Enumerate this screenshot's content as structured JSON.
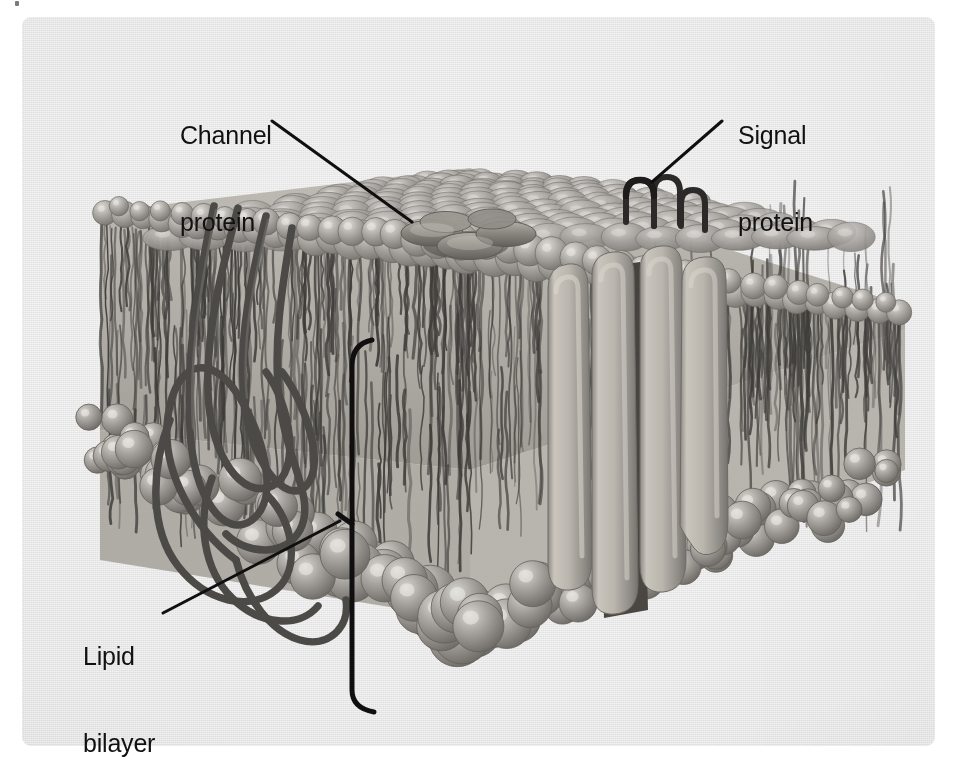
{
  "figure": {
    "background_color": "#e9e9e9",
    "page_color": "#ffffff",
    "ink_color": "#111111",
    "panel": {
      "x": 22,
      "y": 17,
      "width": 913,
      "height": 729,
      "corner_radius": 9
    }
  },
  "labels": [
    {
      "id": "channel-protein",
      "text_line1": "Channel",
      "text_line2": "protein",
      "x": 180,
      "y": 63,
      "leader": {
        "x1": 272,
        "y1": 121,
        "x2": 412,
        "y2": 222
      }
    },
    {
      "id": "signal-protein",
      "text_line1": "Signal",
      "text_line2": "protein",
      "x": 738,
      "y": 63,
      "leader": {
        "x1": 722,
        "y1": 121,
        "x2": 652,
        "y2": 182
      }
    },
    {
      "id": "lipid-bilayer",
      "text_line1": "Lipid",
      "text_line2": "bilayer",
      "x": 83,
      "y": 584,
      "leader": {
        "x1": 163,
        "y1": 613,
        "x2": 320,
        "y2": 532
      }
    }
  ],
  "structures": {
    "lipid_bilayer": {
      "name": "Lipid bilayer",
      "upper_leaflet_heads": 220,
      "lower_leaflet_heads": 95,
      "tail_color": "#3a3a3a",
      "head_color": "#8e8e8e",
      "bracket": {
        "x": 352,
        "top_y": 344,
        "bottom_y": 712
      }
    },
    "channel_protein": {
      "name": "Channel protein",
      "description": "flattened disc subunits embedded in outer leaflet",
      "center_x": 455,
      "center_y": 238,
      "subunit_count": 5
    },
    "signal_protein": {
      "name": "Signal protein",
      "description": "dark hairpin loops protruding above membrane surface",
      "center_x": 652,
      "center_y": 190,
      "loop_count": 3
    },
    "transmembrane_columns": {
      "name": "Transmembrane protein columns",
      "count": 4,
      "fill_color": "#b9b4ac",
      "pore_color": "#4a4743",
      "top_y": 262,
      "bottom_y": 620
    },
    "peripheral_protein_strand": {
      "name": "Coiled peripheral protein strand",
      "color": "#4a4a4a",
      "region": {
        "x": 120,
        "y": 205,
        "width": 190,
        "height": 450
      }
    }
  }
}
